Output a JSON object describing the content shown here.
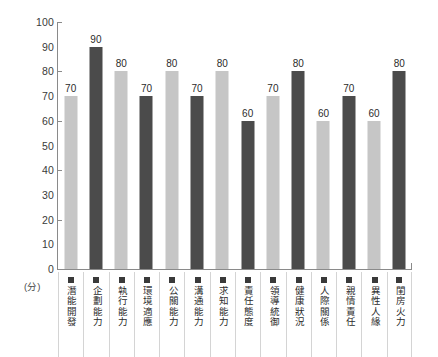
{
  "chart_data": {
    "type": "bar",
    "title": "",
    "xlabel": "",
    "ylabel": "(分)",
    "ylim": [
      0,
      100
    ],
    "ytick_step": 10,
    "ytick_labels": [
      "100",
      "90",
      "80",
      "70",
      "60",
      "50",
      "40",
      "30",
      "20",
      "10",
      "0"
    ],
    "major_ticks": [
      100,
      80,
      60,
      40,
      20,
      0
    ],
    "grid": false,
    "legend": "none",
    "categories": [
      "潛能開發",
      "企劃能力",
      "執行能力",
      "環境適應",
      "公關能力",
      "溝通能力",
      "求知能力",
      "責任態度",
      "領導統御",
      "健康狀況",
      "人際關係",
      "親情責任",
      "異性人緣",
      "閨房火力"
    ],
    "values": [
      70,
      90,
      80,
      70,
      80,
      70,
      80,
      60,
      70,
      80,
      60,
      70,
      60,
      80
    ],
    "bar_colors": [
      "#c6c6c6",
      "#4b4b4b",
      "#c6c6c6",
      "#4b4b4b",
      "#c6c6c6",
      "#4b4b4b",
      "#c6c6c6",
      "#4b4b4b",
      "#c6c6c6",
      "#4b4b4b",
      "#c6c6c6",
      "#4b4b4b",
      "#c6c6c6",
      "#4b4b4b"
    ],
    "colors": {
      "light_bar": "#c6c6c6",
      "dark_bar": "#4b4b4b",
      "axis": "#8a8a8a",
      "text": "#2b2b2b",
      "background": "#ffffff",
      "separator": "#d4d4d4",
      "marker": "#3a3a3a"
    },
    "marker_icon": "square-marker"
  }
}
